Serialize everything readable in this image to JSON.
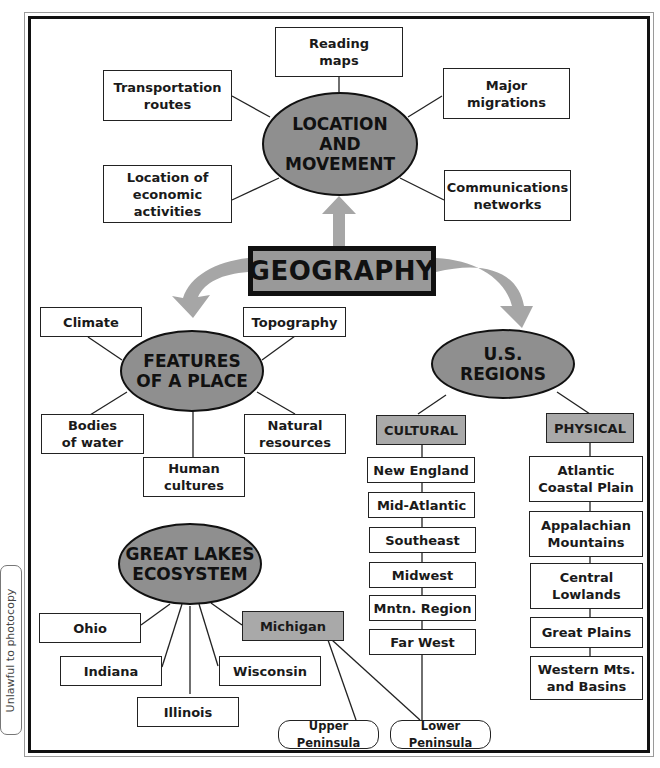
{
  "title": "GEOGRAPHY",
  "side_note": "Unlawful to photocopy",
  "colors": {
    "oval_fill": "#8f8f8f",
    "shaded_box": "#a9a9a9",
    "arrow": "#a6a6a6",
    "border": "#111111"
  },
  "location_movement": {
    "label": "LOCATION\nAND\nMOVEMENT",
    "children": [
      "Reading\nmaps",
      "Transportation\nroutes",
      "Major\nmigrations",
      "Location of\neconomic\nactivities",
      "Communications\nnetworks"
    ]
  },
  "features_of_a_place": {
    "label": "FEATURES\nOF A PLACE",
    "children": [
      "Climate",
      "Topography",
      "Bodies\nof water",
      "Human\ncultures",
      "Natural\nresources"
    ]
  },
  "us_regions": {
    "label": "U.S.\nREGIONS",
    "cultural": {
      "label": "CULTURAL",
      "items": [
        "New England",
        "Mid-Atlantic",
        "Southeast",
        "Midwest",
        "Mntn. Region",
        "Far West"
      ]
    },
    "physical": {
      "label": "PHYSICAL",
      "items": [
        "Atlantic\nCoastal Plain",
        "Appalachian\nMountains",
        "Central\nLowlands",
        "Great Plains",
        "Western Mts.\nand Basins"
      ]
    }
  },
  "great_lakes": {
    "label": "GREAT LAKES\nECOSYSTEM",
    "states": [
      "Ohio",
      "Indiana",
      "Illinois",
      "Wisconsin",
      "Michigan"
    ],
    "michigan_children": [
      "Upper Peninsula",
      "Lower Peninsula"
    ]
  }
}
